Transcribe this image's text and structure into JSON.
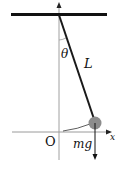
{
  "diagram": {
    "type": "simple-pendulum",
    "labels": {
      "angle": "θ",
      "length": "L",
      "origin": "O",
      "force": "mg",
      "x_axis": "x"
    },
    "colors": {
      "ceiling": "#111111",
      "rod": "#1a1a1a",
      "axis": "#9a9a9a",
      "bob": "#8c8c8c",
      "arrow": "#111111"
    }
  }
}
